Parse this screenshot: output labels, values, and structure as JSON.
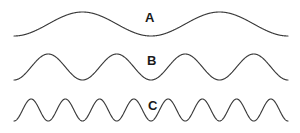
{
  "figure": {
    "background_color": "#ffffff",
    "stroke_color": "#3a3a3a",
    "label_color": "#1a1a1a",
    "width": 300,
    "height": 133
  },
  "labels": {
    "a": "A",
    "b": "B",
    "c": "C"
  },
  "chart_data": {
    "type": "line",
    "title": "",
    "subtitle": "",
    "xlabel": "",
    "ylabel": "",
    "grid": false,
    "legend_position": "inline-right",
    "axis_visible": false,
    "x_start_px": 14,
    "x_end_px": 288,
    "series": [
      {
        "name": "A",
        "label": "A",
        "cycles": 2,
        "amplitude_px": 12,
        "baseline_y_px": 24,
        "phase": "starts at minimum, rises to peak",
        "relative_frequency": 1,
        "relative_wavelength": 4,
        "label_x_px": 145,
        "label_y_px": 11
      },
      {
        "name": "B",
        "label": "B",
        "cycles": 4,
        "amplitude_px": 13,
        "baseline_y_px": 67,
        "phase": "starts at minimum, rises to peak",
        "relative_frequency": 2,
        "relative_wavelength": 2,
        "label_x_px": 147,
        "label_y_px": 54
      },
      {
        "name": "C",
        "label": "C",
        "cycles": 8,
        "amplitude_px": 11,
        "baseline_y_px": 110,
        "phase": "starts at minimum, rises to peak",
        "relative_frequency": 4,
        "relative_wavelength": 1,
        "label_x_px": 148,
        "label_y_px": 99
      }
    ],
    "ylim": [
      0,
      133
    ],
    "xlim": [
      0,
      300
    ]
  }
}
